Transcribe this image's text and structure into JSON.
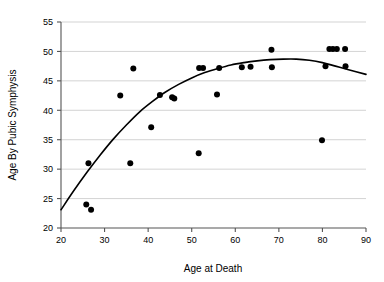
{
  "chart_data": {
    "type": "scatter",
    "title": "",
    "xlabel": "Age at Death",
    "ylabel": "Age By Pubic Symphysis",
    "xlim": [
      20,
      90
    ],
    "ylim": [
      20,
      55
    ],
    "xticks": [
      20,
      30,
      40,
      50,
      60,
      70,
      80,
      90
    ],
    "yticks": [
      20,
      25,
      30,
      35,
      40,
      45,
      50,
      55
    ],
    "grid": "horizontal",
    "legend": "none",
    "point_color": "#000000",
    "curve_color": "#000000",
    "gridline_color": "#c8c8c8",
    "axis_color": "#555555",
    "background_color": "#ffffff",
    "points": [
      {
        "x": 25.8,
        "y": 24.0
      },
      {
        "x": 26.3,
        "y": 31.0
      },
      {
        "x": 26.9,
        "y": 23.1
      },
      {
        "x": 33.6,
        "y": 42.5
      },
      {
        "x": 35.9,
        "y": 31.0
      },
      {
        "x": 36.6,
        "y": 47.1
      },
      {
        "x": 40.7,
        "y": 37.1
      },
      {
        "x": 42.7,
        "y": 42.6
      },
      {
        "x": 45.5,
        "y": 42.2
      },
      {
        "x": 46.0,
        "y": 42.0
      },
      {
        "x": 51.6,
        "y": 32.7
      },
      {
        "x": 51.7,
        "y": 47.2
      },
      {
        "x": 52.6,
        "y": 47.2
      },
      {
        "x": 55.8,
        "y": 42.7
      },
      {
        "x": 56.3,
        "y": 47.2
      },
      {
        "x": 61.5,
        "y": 47.3
      },
      {
        "x": 63.5,
        "y": 47.4
      },
      {
        "x": 68.3,
        "y": 50.3
      },
      {
        "x": 68.4,
        "y": 47.3
      },
      {
        "x": 79.9,
        "y": 34.9
      },
      {
        "x": 80.7,
        "y": 47.5
      },
      {
        "x": 81.6,
        "y": 50.4
      },
      {
        "x": 82.4,
        "y": 50.4
      },
      {
        "x": 83.3,
        "y": 50.4
      },
      {
        "x": 85.2,
        "y": 50.4
      },
      {
        "x": 85.3,
        "y": 47.5
      }
    ],
    "fit_curve": {
      "label": "fitted regression curve",
      "points": [
        {
          "x": 20.0,
          "y": 23.1
        },
        {
          "x": 23.0,
          "y": 26.4
        },
        {
          "x": 26.0,
          "y": 29.5
        },
        {
          "x": 29.0,
          "y": 32.4
        },
        {
          "x": 32.0,
          "y": 35.1
        },
        {
          "x": 35.0,
          "y": 37.5
        },
        {
          "x": 38.0,
          "y": 39.7
        },
        {
          "x": 41.0,
          "y": 41.5
        },
        {
          "x": 44.0,
          "y": 43.1
        },
        {
          "x": 47.0,
          "y": 44.4
        },
        {
          "x": 50.0,
          "y": 45.5
        },
        {
          "x": 53.0,
          "y": 46.4
        },
        {
          "x": 56.0,
          "y": 47.1
        },
        {
          "x": 59.0,
          "y": 47.7
        },
        {
          "x": 62.0,
          "y": 48.1
        },
        {
          "x": 65.0,
          "y": 48.4
        },
        {
          "x": 68.0,
          "y": 48.6
        },
        {
          "x": 71.0,
          "y": 48.7
        },
        {
          "x": 74.0,
          "y": 48.7
        },
        {
          "x": 77.0,
          "y": 48.5
        },
        {
          "x": 80.0,
          "y": 48.1
        },
        {
          "x": 83.0,
          "y": 47.5
        },
        {
          "x": 86.0,
          "y": 46.9
        },
        {
          "x": 90.0,
          "y": 46.1
        }
      ]
    }
  }
}
